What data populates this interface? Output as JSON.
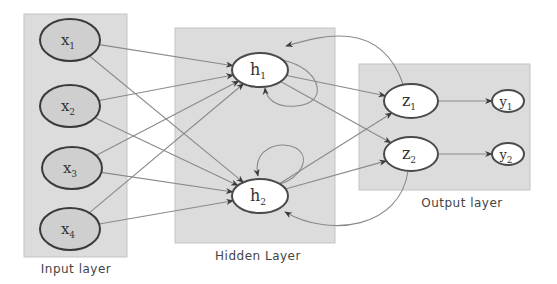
{
  "diagram": {
    "layers": [
      {
        "id": "input",
        "label": "Input layer"
      },
      {
        "id": "hidden",
        "label": "Hidden Layer"
      },
      {
        "id": "output",
        "label": "Output layer"
      }
    ],
    "nodes": {
      "x1": {
        "base": "x",
        "sub": "1"
      },
      "x2": {
        "base": "x",
        "sub": "2"
      },
      "x3": {
        "base": "x",
        "sub": "3"
      },
      "x4": {
        "base": "x",
        "sub": "4"
      },
      "h1": {
        "base": "h",
        "sub": "1"
      },
      "h2": {
        "base": "h",
        "sub": "2"
      },
      "z1": {
        "base": "z",
        "sub": "1"
      },
      "z2": {
        "base": "z",
        "sub": "2"
      },
      "y1": {
        "base": "y",
        "sub": "1"
      },
      "y2": {
        "base": "y",
        "sub": "2"
      }
    },
    "edges": [
      [
        "x1",
        "h1"
      ],
      [
        "x1",
        "h2"
      ],
      [
        "x2",
        "h1"
      ],
      [
        "x2",
        "h2"
      ],
      [
        "x3",
        "h1"
      ],
      [
        "x3",
        "h2"
      ],
      [
        "x4",
        "h1"
      ],
      [
        "x4",
        "h2"
      ],
      [
        "h1",
        "z1"
      ],
      [
        "h1",
        "z2"
      ],
      [
        "h2",
        "z1"
      ],
      [
        "h2",
        "z2"
      ],
      [
        "z1",
        "y1"
      ],
      [
        "z2",
        "y2"
      ]
    ],
    "recurrent_edges": [
      [
        "h1",
        "h1"
      ],
      [
        "h2",
        "h2"
      ],
      [
        "z1",
        "h1"
      ],
      [
        "z2",
        "h2"
      ]
    ]
  }
}
